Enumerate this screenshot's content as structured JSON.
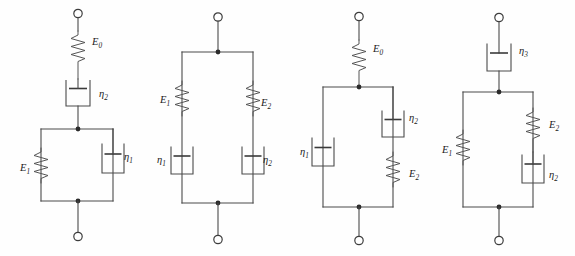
{
  "figure": {
    "background_color": "#fefefe",
    "line_color": "#4a4a4a",
    "label_color": "#1a1a1a",
    "model_count": 4
  },
  "models": [
    {
      "id": "model-1",
      "name": "Spring E0 in series with dashpot eta2 and Kelvin-Voigt unit (E1 parallel eta1)",
      "elements": [
        {
          "kind": "spring",
          "label_base": "E",
          "label_sub": "0",
          "label": "E₀",
          "position": "series-top"
        },
        {
          "kind": "dashpot",
          "label_base": "η",
          "label_sub": "2",
          "label": "η₂",
          "position": "series-middle"
        },
        {
          "kind": "spring",
          "label_base": "E",
          "label_sub": "1",
          "label": "E₁",
          "position": "parallel-left"
        },
        {
          "kind": "dashpot",
          "label_base": "η",
          "label_sub": "1",
          "label": "η₁",
          "position": "parallel-right"
        }
      ]
    },
    {
      "id": "model-2",
      "name": "Two Maxwell branches in parallel",
      "elements": [
        {
          "kind": "spring",
          "label_base": "E",
          "label_sub": "1",
          "label": "E₁",
          "position": "parallel-left-upper"
        },
        {
          "kind": "dashpot",
          "label_base": "η",
          "label_sub": "1",
          "label": "η₁",
          "position": "parallel-left-lower"
        },
        {
          "kind": "spring",
          "label_base": "E",
          "label_sub": "2",
          "label": "E₂",
          "position": "parallel-right-upper"
        },
        {
          "kind": "dashpot",
          "label_base": "η",
          "label_sub": "2",
          "label": "η₂",
          "position": "parallel-right-lower"
        }
      ]
    },
    {
      "id": "model-3",
      "name": "Spring E0 in series with parallel set of dashpot eta1 and Maxwell branch eta2-E2",
      "elements": [
        {
          "kind": "spring",
          "label_base": "E",
          "label_sub": "0",
          "label": "E₀",
          "position": "series-top"
        },
        {
          "kind": "dashpot",
          "label_base": "η",
          "label_sub": "1",
          "label": "η₁",
          "position": "parallel-left"
        },
        {
          "kind": "dashpot",
          "label_base": "η",
          "label_sub": "2",
          "label": "η₂",
          "position": "parallel-right-upper"
        },
        {
          "kind": "spring",
          "label_base": "E",
          "label_sub": "2",
          "label": "E₂",
          "position": "parallel-right-lower"
        }
      ]
    },
    {
      "id": "model-4",
      "name": "Dashpot eta3 in series with parallel set of spring E1 and Maxwell branch E2-eta2",
      "elements": [
        {
          "kind": "dashpot",
          "label_base": "η",
          "label_sub": "3",
          "label": "η₃",
          "position": "series-top"
        },
        {
          "kind": "spring",
          "label_base": "E",
          "label_sub": "1",
          "label": "E₁",
          "position": "parallel-left"
        },
        {
          "kind": "spring",
          "label_base": "E",
          "label_sub": "2",
          "label": "E₂",
          "position": "parallel-right-upper"
        },
        {
          "kind": "dashpot",
          "label_base": "η",
          "label_sub": "2",
          "label": "η₂",
          "position": "parallel-right-lower"
        }
      ]
    }
  ],
  "labels": {
    "m1_E0": {
      "base": "E",
      "sub": "0",
      "x": 92,
      "y": 45
    },
    "m1_eta2": {
      "base": "η",
      "sub": "2",
      "x": 99,
      "y": 97
    },
    "m1_E1": {
      "base": "E",
      "sub": "1",
      "x": 20,
      "y": 171
    },
    "m1_eta1": {
      "base": "η",
      "sub": "1",
      "x": 124,
      "y": 160
    },
    "m2_E1": {
      "base": "E",
      "sub": "1",
      "x": 160,
      "y": 103
    },
    "m2_eta1": {
      "base": "η",
      "sub": "1",
      "x": 157,
      "y": 163
    },
    "m2_E2": {
      "base": "E",
      "sub": "2",
      "x": 261,
      "y": 106
    },
    "m2_eta2": {
      "base": "η",
      "sub": "2",
      "x": 263,
      "y": 163
    },
    "m3_E0": {
      "base": "E",
      "sub": "0",
      "x": 373,
      "y": 52
    },
    "m3_eta1": {
      "base": "η",
      "sub": "1",
      "x": 300,
      "y": 155
    },
    "m3_eta2": {
      "base": "η",
      "sub": "2",
      "x": 409,
      "y": 121
    },
    "m3_E2": {
      "base": "E",
      "sub": "2",
      "x": 409,
      "y": 177
    },
    "m4_eta3": {
      "base": "η",
      "sub": "3",
      "x": 519,
      "y": 54
    },
    "m4_E1": {
      "base": "E",
      "sub": "1",
      "x": 442,
      "y": 153
    },
    "m4_E2": {
      "base": "E",
      "sub": "2",
      "x": 549,
      "y": 128
    },
    "m4_eta2": {
      "base": "η",
      "sub": "2",
      "x": 549,
      "y": 178
    }
  }
}
